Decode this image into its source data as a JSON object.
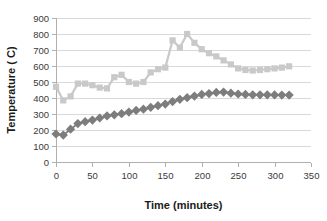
{
  "chart_data": {
    "type": "line",
    "title": "",
    "xlabel": "Time (minutes)",
    "ylabel": "Temperature ( C)",
    "xlim": [
      0,
      350
    ],
    "ylim": [
      0,
      900
    ],
    "xticks": [
      0,
      50,
      100,
      150,
      200,
      250,
      300,
      350
    ],
    "yticks": [
      0,
      100,
      200,
      300,
      400,
      500,
      600,
      700,
      800,
      900
    ],
    "grid": "horizontal",
    "legend": "none",
    "series": [
      {
        "name": "upper-series",
        "marker": "square",
        "color": "#c9c9c9",
        "x": [
          0,
          10,
          20,
          30,
          40,
          50,
          60,
          70,
          80,
          90,
          100,
          110,
          120,
          130,
          140,
          150,
          160,
          170,
          180,
          190,
          200,
          210,
          220,
          230,
          240,
          250,
          260,
          270,
          280,
          290,
          300,
          310,
          320
        ],
        "y": [
          470,
          385,
          410,
          490,
          490,
          480,
          465,
          460,
          530,
          545,
          500,
          490,
          500,
          560,
          580,
          590,
          760,
          715,
          800,
          745,
          705,
          680,
          660,
          635,
          610,
          585,
          575,
          572,
          575,
          580,
          585,
          590,
          598
        ]
      },
      {
        "name": "lower-series",
        "marker": "diamond",
        "color": "#7d7d7d",
        "x": [
          0,
          10,
          20,
          30,
          40,
          50,
          60,
          70,
          80,
          90,
          100,
          110,
          120,
          130,
          140,
          150,
          160,
          170,
          180,
          190,
          200,
          210,
          220,
          230,
          240,
          250,
          260,
          270,
          280,
          290,
          300,
          310,
          320
        ],
        "y": [
          175,
          168,
          205,
          240,
          252,
          262,
          275,
          288,
          295,
          302,
          312,
          322,
          330,
          342,
          352,
          362,
          378,
          392,
          402,
          412,
          422,
          428,
          435,
          437,
          430,
          425,
          422,
          420,
          420,
          420,
          419,
          418,
          418
        ]
      }
    ]
  },
  "axes": {
    "x_title": "Time (minutes)",
    "y_title": "Temperature ( C)"
  }
}
